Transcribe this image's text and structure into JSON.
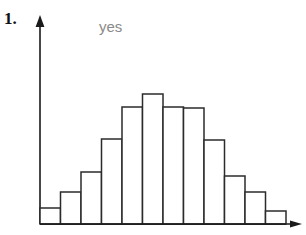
{
  "page": {
    "question_number": "1.",
    "answer_label": "yes",
    "background_color": "#ffffff"
  },
  "colors": {
    "ink": "#1a1a1a",
    "axis": "#1a1a1a",
    "bar_stroke": "#2b2b2b",
    "bar_fill": "#ffffff",
    "answer_text": "#8a8a8a",
    "number_text": "#111111"
  },
  "figure": {
    "name": "histogram-figure",
    "axes": {
      "y_axis": {
        "x": 40,
        "y_bottom": 224,
        "y_top": 18,
        "arrow": "up-arrow"
      },
      "x_axis": {
        "y": 224,
        "x_left": 40,
        "x_right": 300,
        "arrow": "right-arrow"
      }
    },
    "baseline_y": 224,
    "origin_x": 40,
    "bar_width": 20.5
  },
  "chart_data": {
    "type": "bar",
    "title": "",
    "subtitle": "",
    "xlabel": "",
    "ylabel": "",
    "categories": [
      "1",
      "2",
      "3",
      "4",
      "5",
      "6",
      "7",
      "8",
      "9",
      "10",
      "11",
      "12"
    ],
    "values": [
      16,
      32,
      52,
      85,
      117,
      130,
      117,
      116,
      84,
      48,
      32,
      13
    ],
    "ylim": [
      0,
      140
    ],
    "xlim": [
      0,
      12
    ],
    "grid": false,
    "legend": null,
    "tick_labels": {
      "x": [],
      "y": []
    },
    "annotations": [
      {
        "text": "yes",
        "x": 99,
        "y": 17
      }
    ]
  }
}
